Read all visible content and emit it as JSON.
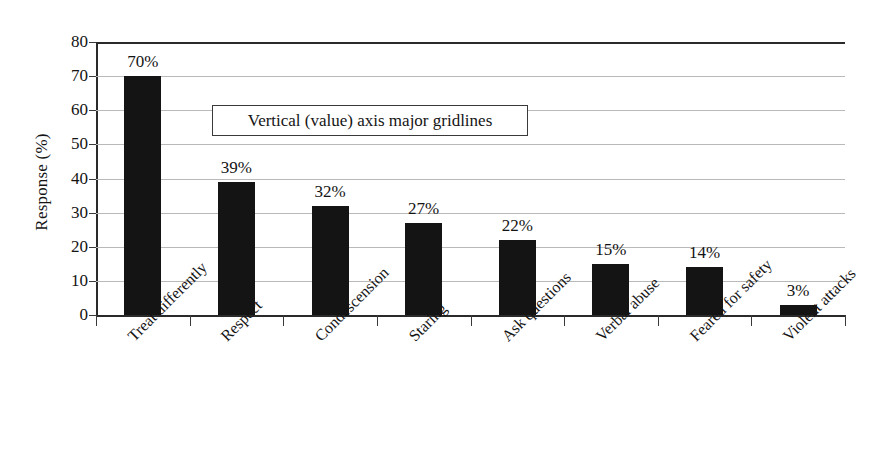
{
  "chart_data": {
    "type": "bar",
    "title": "",
    "subtitle": "",
    "xlabel": "",
    "ylabel": "Response (%)",
    "ylim": [
      0,
      80
    ],
    "ytick_step": 10,
    "yticks": [
      "80",
      "70",
      "60",
      "50",
      "40",
      "30",
      "20",
      "10",
      "0"
    ],
    "grid": true,
    "grid_axis": "y",
    "legend": false,
    "legend_position": "none",
    "categories": [
      "Treat differently",
      "Respect",
      "Condescension",
      "Staring",
      "Ask questions",
      "Verbal abuse",
      "Feared for safety",
      "Violent attacks"
    ],
    "values": [
      70,
      39,
      32,
      27,
      22,
      15,
      14,
      3
    ],
    "data_labels": [
      "70%",
      "39%",
      "32%",
      "27%",
      "22%",
      "15%",
      "14%",
      "3%"
    ],
    "annotations": [
      {
        "text": "Vertical (value) axis major gridlines",
        "kind": "callout-box"
      }
    ],
    "colors": {
      "bar": "#141414",
      "gridline": "#b9b9b9",
      "axis": "#2a2a2a",
      "text": "#141414",
      "background": "#ffffff"
    }
  }
}
